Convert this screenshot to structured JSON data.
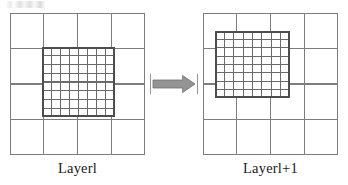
{
  "figure": {
    "width": 348,
    "height": 185,
    "background": "#ffffff",
    "title_present": false
  },
  "colors": {
    "coarse_line": "#7d7d7d",
    "fine_line": "#6a6a6a",
    "fine_border": "#4d4d4d",
    "arrow_fill": "#949494",
    "arrow_stroke": "#6f6f6f",
    "tick_line": "#8a8a8a",
    "text": "#1a1a1a",
    "background": "#ffffff"
  },
  "left_panel": {
    "name": "layer-l-panel",
    "coarse_grid": {
      "rows": 4,
      "cols": 4,
      "x": 10,
      "y": 13,
      "width": 135,
      "height": 142,
      "line_width": 1.15
    },
    "fine_grid": {
      "rows": 8,
      "cols": 8,
      "x": 42,
      "y": 47,
      "width": 73,
      "height": 70,
      "line_width": 1.1,
      "border_width": 1.6
    },
    "caption": "Layerl",
    "caption_x": 10,
    "caption_y": 161,
    "caption_width": 135
  },
  "right_panel": {
    "name": "layer-l-plus-1-panel",
    "coarse_grid": {
      "rows": 4,
      "cols": 4,
      "x": 203,
      "y": 13,
      "width": 135,
      "height": 142,
      "line_width": 1.15
    },
    "fine_grid": {
      "rows": 8,
      "cols": 8,
      "x": 215,
      "y": 31,
      "width": 75,
      "height": 67,
      "line_width": 1.1,
      "border_width": 1.6
    },
    "caption": "Layerl+1",
    "caption_x": 203,
    "caption_y": 161,
    "caption_width": 135
  },
  "arrow": {
    "name": "rightwards-transition-arrow",
    "x": 150,
    "y": 72,
    "width": 48,
    "height": 24,
    "direction": "right",
    "shaft_top": 8,
    "shaft_bottom": 16,
    "head_start": 0.68,
    "tick_marks": 2
  },
  "captions": {
    "left": "Layerl",
    "right": "Layerl+1"
  }
}
